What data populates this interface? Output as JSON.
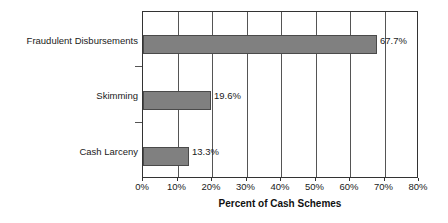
{
  "chart_data": {
    "type": "bar",
    "orientation": "horizontal",
    "title": "",
    "xlabel": "Percent of Cash Schemes",
    "ylabel": "",
    "categories": [
      "Fraudulent Disbursements",
      "Skimming",
      "Cash Larceny"
    ],
    "values": [
      67.7,
      19.6,
      13.3
    ],
    "value_labels": [
      "67.7%",
      "19.6%",
      "13.3%"
    ],
    "xlim": [
      0,
      80
    ],
    "xticks": [
      0,
      10,
      20,
      30,
      40,
      50,
      60,
      70,
      80
    ],
    "xtick_labels": [
      "0%",
      "10%",
      "20%",
      "30%",
      "40%",
      "50%",
      "60%",
      "70%",
      "80%"
    ],
    "grid": true,
    "grid_axis": "x",
    "legend": false,
    "legend_position": "none",
    "series": [
      {
        "name": "Percent of Cash Schemes",
        "values": [
          67.7,
          19.6,
          13.3
        ],
        "color": "#808080"
      }
    ],
    "colors": {
      "bar_fill": "#808080",
      "bar_border": "#4a4a4a",
      "frame": "#333333",
      "gridline": "#555555",
      "text": "#1a1a1a",
      "background": "#ffffff"
    }
  }
}
